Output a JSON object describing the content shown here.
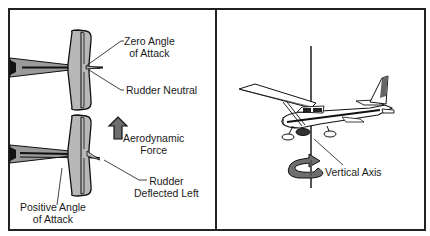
{
  "diagram": {
    "left_panel": {
      "top_view": {
        "labels": {
          "zero_angle": [
            "Zero Angle",
            "of Attack"
          ],
          "rudder_neutral": "Rudder Neutral"
        }
      },
      "bottom_view": {
        "labels": {
          "aerodynamic_force": [
            "Aerodynamic",
            "Force"
          ],
          "rudder_deflected": [
            "Rudder",
            "Deflected Left"
          ],
          "positive_angle": [
            "Positive Angle",
            "of Attack"
          ]
        }
      }
    },
    "right_panel": {
      "labels": {
        "vertical_axis": "Vertical Axis"
      }
    },
    "colors": {
      "outline": "#1a1a1a",
      "fill_gray": "#b8b8b8",
      "arrow_gray": "#6e6e6e",
      "background": "#ffffff"
    }
  }
}
